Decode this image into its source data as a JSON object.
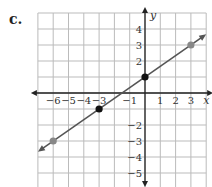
{
  "problem_label": "c.",
  "chart_data": {
    "type": "line",
    "title": "",
    "xlabel": "x",
    "ylabel": "y",
    "xlim": [
      -7,
      4
    ],
    "ylim": [
      -5.9,
      5
    ],
    "grid": true,
    "x_ticks": [
      -6,
      -5,
      -4,
      -3,
      -1,
      1,
      2,
      3
    ],
    "y_ticks": [
      4,
      3,
      2,
      -2,
      -3,
      -4,
      -5
    ],
    "line": {
      "slope": 0.6667,
      "intercept": 1,
      "equation": "y = 2/3 x + 1",
      "color": "#555555"
    },
    "points": [
      {
        "x": -6,
        "y": -3,
        "color": "#888888"
      },
      {
        "x": -3,
        "y": -1,
        "color": "#111111"
      },
      {
        "x": 0,
        "y": 1,
        "color": "#111111"
      },
      {
        "x": 3,
        "y": 3,
        "color": "#888888"
      }
    ]
  },
  "colors": {
    "grid": "#bbbbbb",
    "axis": "#222222",
    "line": "#555555"
  }
}
